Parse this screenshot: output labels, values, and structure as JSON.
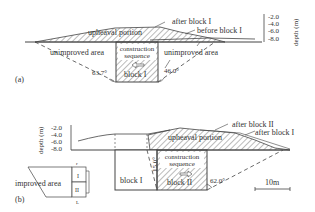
{
  "panel_a": {
    "tag": "(a)",
    "upheaval_label": "upheaval portion",
    "after_label": "after block I",
    "before_label": "before block I",
    "left_area_label": "unimproved area",
    "right_area_label": "unimproved area",
    "construction_line1": "construction",
    "construction_line2": "sequence",
    "block_label": "block I",
    "left_angle": "63.7°",
    "right_angle": "46.0°",
    "depth_axis_label": "depth (m)",
    "depth_ticks": [
      "-2.0",
      "-4.0",
      "-6.0",
      "-8.0"
    ]
  },
  "panel_b": {
    "tag": "(b)",
    "upheaval_label": "upheaval portion",
    "after_block2_label": "after block II",
    "after_block1_label": "after block I",
    "block1_label": "block I",
    "block2_label": "block II",
    "construction_line1": "construction",
    "construction_line2": "sequence",
    "left_angle": "15.0°",
    "right_angle": "62.0°",
    "depth_axis_label": "depth (m)",
    "depth_ticks": [
      "-2.0",
      "-4.0",
      "-6.0",
      "-8.0"
    ],
    "scale_label": "10m",
    "inset": {
      "area_label": "improved area",
      "block1": "I",
      "block2": "II",
      "top_mark": "r",
      "bottom_mark": "L"
    }
  }
}
